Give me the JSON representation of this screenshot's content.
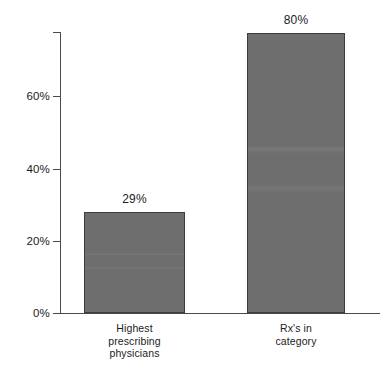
{
  "chart_data": {
    "type": "bar",
    "title": "",
    "subtitle": "",
    "xlabel": "",
    "ylabel": "",
    "categories": [
      "Highest prescribing physicians",
      "Rx's in category"
    ],
    "category_label_lines": [
      [
        "Highest",
        "prescribing",
        "physicians"
      ],
      [
        "Rx's in",
        "category"
      ]
    ],
    "values": [
      29,
      80
    ],
    "value_labels": [
      "29%",
      "80%"
    ],
    "ylim": [
      0,
      80
    ],
    "yticks": [
      0,
      20,
      40,
      60
    ],
    "ytick_labels": [
      "0%",
      "20%",
      "40%",
      "60%"
    ],
    "grid": false,
    "legend": null,
    "bar_color": "#6e6e6e",
    "bar_border_color": "#3c3c3c",
    "axis_color": "#4a4a4a",
    "text_color": "#1c1c1c",
    "background": "#ffffff"
  }
}
